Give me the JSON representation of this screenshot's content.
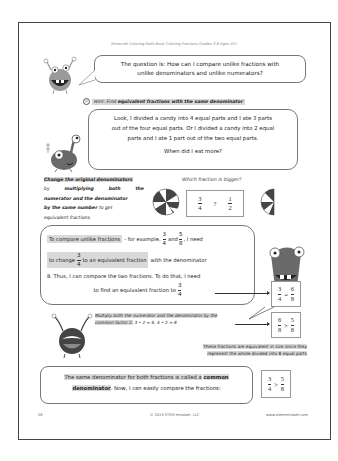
{
  "page": {
    "running_head": "Minecraft Coloring Math Book Coloring Fractions Grades 3-6 Ages 10+",
    "page_number": "58",
    "copyright": "© 2019 STEM mindset, LLC",
    "website": "www.stemmindset.com"
  },
  "question_bubble": {
    "line1": "The question is: How can I compare unlike fractions with",
    "line2": "unlike denominators and unlike numerators?"
  },
  "hint": {
    "icon": "smiley-icon",
    "prefix": "Hint:",
    "text_plain": "Find",
    "text_bold": "equivalent fractions with the same denominator"
  },
  "candy_bubble": {
    "line1": "Look, I divided a candy into 4 equal parts and I ate 3 parts",
    "line2": "out of the four equal parts. Or I divided a candy into 2 equal",
    "line3": "parts and I ate 1 part out of the two equal parts.",
    "question": "When did I eat more?"
  },
  "side_note": {
    "bold1": "Change the original denominators",
    "line2a": "by",
    "line2b": "multiplying",
    "line2c": "both",
    "line2d": "the",
    "line3": "numerator and the denominator",
    "line4a": "by the same number",
    "line4b": "to get",
    "line5": "equivalent fractions."
  },
  "which_bigger": {
    "caption": "Which fraction is bigger?",
    "left": {
      "num": "3",
      "den": "4"
    },
    "symbol": "?",
    "right": {
      "num": "1",
      "den": "2"
    }
  },
  "compare_bubble": {
    "l1_hl": "To compare unlike fractions",
    "l1_rest": "- for example,",
    "f1": {
      "num": "3",
      "den": "4"
    },
    "and": "and",
    "f2": {
      "num": "5",
      "den": "8"
    },
    "l1_end": ", I need",
    "l2_a": "to change",
    "f3": {
      "num": "3",
      "den": "4"
    },
    "l2_hl": "to an equivalent fraction",
    "l2_rest": "with the denominator",
    "l3": "8. Thus, I can compare the two fractions. To do that, I need",
    "l4": "to find an equivalent fraction to",
    "f4": {
      "num": "3",
      "den": "4"
    }
  },
  "equiv_box": {
    "a": {
      "num": "3",
      "den": "4"
    },
    "op": "=",
    "b": {
      "num": "6",
      "den": "8"
    }
  },
  "multiply_note": {
    "line1": "Multiply both the numerator and the denominator by the",
    "line2_italic": "common factor 2.",
    "line2_math": "3 • 2 = 6, 4 • 2 = 8"
  },
  "gt_box_1": {
    "a": {
      "num": "6",
      "den": "8"
    },
    "op": ">",
    "b": {
      "num": "5",
      "den": "8"
    }
  },
  "equivalent_note": {
    "line1": "These fractions are equivalent in size since they",
    "line2": "represent the whole divided into 8 equal parts"
  },
  "common_bubble": {
    "l1_a": "The same denominator for both fractions is called a",
    "l1_b": "common",
    "l2_a": "denominator",
    "l2_b": ". Now, I can easily compare the fractions:"
  },
  "gt_box_2": {
    "a": {
      "num": "3",
      "den": "4"
    },
    "op": ">",
    "b": {
      "num": "5",
      "den": "8"
    }
  }
}
